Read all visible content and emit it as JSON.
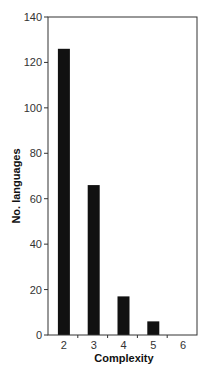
{
  "chart_data": {
    "type": "bar",
    "title": "",
    "xlabel": "Complexity",
    "ylabel": "No. languages",
    "categories": [
      "2",
      "3",
      "4",
      "5",
      "6"
    ],
    "values": [
      126,
      66,
      17,
      6,
      0
    ],
    "ylim": [
      0,
      140
    ],
    "yticks": [
      0,
      20,
      40,
      60,
      80,
      100,
      120,
      140
    ],
    "grid": false,
    "legend": null,
    "colors": {
      "bar": "#111111",
      "axis": "#333333",
      "tick_label": "#333333",
      "axis_label": "#111111"
    }
  }
}
